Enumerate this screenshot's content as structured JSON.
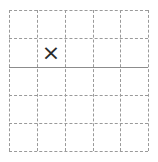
{
  "board": {
    "rows": 5,
    "cols": 5,
    "solid_line_after_row": 2,
    "line_color": "#9a9a9a",
    "solid_line_color": "#8c8c8c",
    "cells": [
      [
        "",
        "",
        "",
        "",
        ""
      ],
      [
        "",
        "×",
        "",
        "",
        ""
      ],
      [
        "",
        "",
        "",
        "",
        ""
      ],
      [
        "",
        "",
        "",
        "",
        ""
      ],
      [
        "",
        "",
        "",
        "",
        ""
      ]
    ]
  }
}
